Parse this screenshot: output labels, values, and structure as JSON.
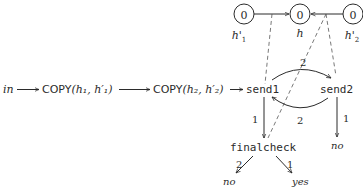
{
  "registers": [
    {
      "id": "h1p",
      "value": "0",
      "label": "h'",
      "sub": "1"
    },
    {
      "id": "h",
      "value": "0",
      "label": "h",
      "sub": ""
    },
    {
      "id": "h2p",
      "value": "0",
      "label": "h'",
      "sub": "2"
    }
  ],
  "pipeline": {
    "input": "in",
    "copy1": {
      "op": "COPY",
      "args": "(h₁, h′₁)"
    },
    "copy2": {
      "op": "COPY",
      "args": "(h₂, h′₂)"
    }
  },
  "states": {
    "send1": "send1",
    "send2": "send2",
    "finalcheck": "finalcheck"
  },
  "edges": {
    "send1_to_send2": "2",
    "send2_to_send1": "2",
    "send1_to_finalcheck": "1",
    "send2_to_no": "1",
    "finalcheck_to_no": "2",
    "finalcheck_to_yes": "1"
  },
  "outcomes": {
    "send2_no": "no",
    "finalcheck_no": "no",
    "finalcheck_yes": "yes"
  },
  "colors": {
    "ink": "#2b2b2b",
    "dashed": "#555555",
    "background": "#ffffff"
  }
}
